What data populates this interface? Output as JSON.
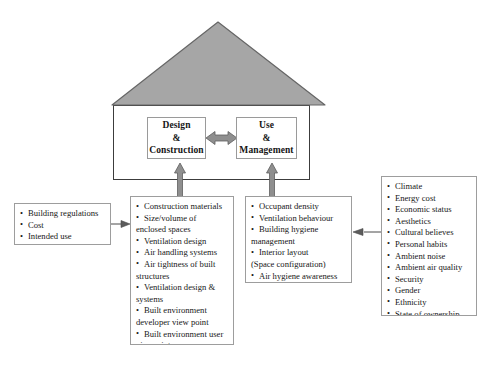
{
  "diagram": {
    "colors": {
      "roof_fill": "#a6a6a6",
      "roof_stroke": "#5a5a5a",
      "wall_stroke": "#3c3c3c",
      "thick_arrow_fill": "#8f8f8f",
      "thick_arrow_stroke": "#5e5e5e",
      "thin_arrow_stroke": "#4a4a4a",
      "box_border": "#9d9d9d",
      "background": "#ffffff",
      "text": "#171717"
    }
  },
  "house": {
    "roof_label": "roof-triangle",
    "wall_label": "house-body",
    "core": {
      "design": {
        "line1": "Design",
        "line2": "&",
        "line3": "Construction"
      },
      "use": {
        "line1": "Use",
        "line2": "&",
        "line3": "Management"
      }
    },
    "connector_label": "bidirectional-arrow"
  },
  "boxes": {
    "regulations": {
      "name": "building-regulations-box",
      "items": [
        {
          "text": "Building regulations",
          "bulleted": true
        },
        {
          "text": "Cost",
          "bulleted": true
        },
        {
          "text": "Intended use",
          "bulleted": true
        }
      ]
    },
    "design_factors": {
      "name": "design-construction-factors-box",
      "items": [
        {
          "text": "Construction materials",
          "bulleted": true
        },
        {
          "text": "Size/volume of",
          "bulleted": true
        },
        {
          "text": "enclosed spaces",
          "bulleted": false
        },
        {
          "text": "Ventilation design",
          "bulleted": true
        },
        {
          "text": "Air handling systems",
          "bulleted": true
        },
        {
          "text": "Air tightness of built",
          "bulleted": true
        },
        {
          "text": "structures",
          "bulleted": false
        },
        {
          "text": "Ventilation design &",
          "bulleted": true
        },
        {
          "text": "systems",
          "bulleted": false
        },
        {
          "text": "Built environment",
          "bulleted": true
        },
        {
          "text": "developer view point",
          "bulleted": false
        },
        {
          "text": "Built environment user",
          "bulleted": true
        },
        {
          "text": "viewpoint",
          "bulleted": false
        },
        {
          "text": "Available land",
          "bulleted": true
        },
        {
          "text": "Building technology",
          "bulleted": true
        }
      ]
    },
    "use_factors": {
      "name": "use-management-factors-box",
      "items": [
        {
          "text": "Occupant density",
          "bulleted": true
        },
        {
          "text": "Ventilation behaviour",
          "bulleted": true
        },
        {
          "text": "Building hygiene",
          "bulleted": true
        },
        {
          "text": "management",
          "bulleted": false
        },
        {
          "text": "Interior layout",
          "bulleted": true
        },
        {
          "text": "(Space configuration)",
          "bulleted": false
        },
        {
          "text": "Air hygiene awareness",
          "bulleted": true
        }
      ]
    },
    "external": {
      "name": "external-factors-box",
      "items": [
        {
          "text": "Climate",
          "bulleted": true
        },
        {
          "text": "Energy cost",
          "bulleted": true
        },
        {
          "text": "Economic status",
          "bulleted": true
        },
        {
          "text": "Aesthetics",
          "bulleted": true
        },
        {
          "text": "Cultural believes",
          "bulleted": true
        },
        {
          "text": "Personal habits",
          "bulleted": true
        },
        {
          "text": "Ambient noise",
          "bulleted": true
        },
        {
          "text": "Ambient air quality",
          "bulleted": true
        },
        {
          "text": "Security",
          "bulleted": true
        },
        {
          "text": "Gender",
          "bulleted": true
        },
        {
          "text": "Ethnicity",
          "bulleted": true
        },
        {
          "text": "State of ownership",
          "bulleted": true
        }
      ]
    }
  },
  "arrows": {
    "regulations_to_design": "arrow-right-thin",
    "external_to_use": "arrow-left-thin",
    "design_factors_up": "arrow-up-thick",
    "use_factors_up": "arrow-up-thick",
    "design_use_link": "arrow-双-horizontal"
  }
}
